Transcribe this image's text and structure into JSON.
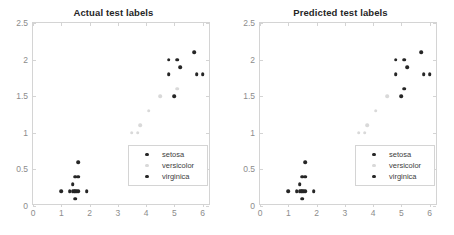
{
  "figure": {
    "background_color": "#ffffff",
    "axis_color": "#d4d4d4",
    "tick_label_color": "#8c8c8c",
    "title_color": "#262626"
  },
  "colors": {
    "setosa": "#262626",
    "versicolor": "#d9d9d9",
    "virginica": "#262626"
  },
  "legend": {
    "entries": [
      {
        "label": "setosa",
        "marker": "filled-circle-dark"
      },
      {
        "label": "versicolor",
        "marker": "filled-circle-light"
      },
      {
        "label": "virginica",
        "marker": "filled-circle-dark"
      }
    ]
  },
  "axis": {
    "xticks": [
      "0",
      "1",
      "2",
      "3",
      "4",
      "5",
      "6"
    ],
    "yticks": [
      "0",
      "0.5",
      "1",
      "1.5",
      "2",
      "2.5"
    ]
  },
  "chart_data": [
    {
      "type": "scatter",
      "title": "Actual test labels",
      "xlabel": "",
      "ylabel": "",
      "xlim": [
        0,
        6.3
      ],
      "ylim": [
        0,
        2.5
      ],
      "xticks": [
        0,
        1,
        2,
        3,
        4,
        5,
        6
      ],
      "yticks": [
        0,
        0.5,
        1,
        1.5,
        2,
        2.5
      ],
      "grid": false,
      "legend_position": "lower-right",
      "series": [
        {
          "name": "setosa",
          "color": "#262626",
          "points": [
            [
              1.0,
              0.2
            ],
            [
              1.3,
              0.2
            ],
            [
              1.4,
              0.2
            ],
            [
              1.45,
              0.2
            ],
            [
              1.5,
              0.2
            ],
            [
              1.55,
              0.2
            ],
            [
              1.6,
              0.2
            ],
            [
              1.9,
              0.2
            ],
            [
              1.4,
              0.3
            ],
            [
              1.5,
              0.4
            ],
            [
              1.6,
              0.4
            ],
            [
              1.6,
              0.6
            ],
            [
              1.5,
              0.1
            ]
          ]
        },
        {
          "name": "versicolor",
          "color": "#d9d9d9",
          "points": [
            [
              3.5,
              1.0
            ],
            [
              3.7,
              1.0
            ],
            [
              3.8,
              1.1
            ],
            [
              4.1,
              1.3
            ],
            [
              4.5,
              1.5
            ],
            [
              5.1,
              1.6
            ]
          ]
        },
        {
          "name": "virginica",
          "color": "#262626",
          "points": [
            [
              4.8,
              2.0
            ],
            [
              5.1,
              2.0
            ],
            [
              5.7,
              2.1
            ],
            [
              4.8,
              1.8
            ],
            [
              5.2,
              1.9
            ],
            [
              5.8,
              1.8
            ],
            [
              6.0,
              1.8
            ],
            [
              5.0,
              1.5
            ]
          ]
        }
      ]
    },
    {
      "type": "scatter",
      "title": "Predicted test labels",
      "xlabel": "",
      "ylabel": "",
      "xlim": [
        0,
        6.3
      ],
      "ylim": [
        0,
        2.5
      ],
      "xticks": [
        0,
        1,
        2,
        3,
        4,
        5,
        6
      ],
      "yticks": [
        0,
        0.5,
        1,
        1.5,
        2,
        2.5
      ],
      "grid": false,
      "legend_position": "lower-right",
      "series": [
        {
          "name": "setosa",
          "color": "#262626",
          "points": [
            [
              1.0,
              0.2
            ],
            [
              1.3,
              0.2
            ],
            [
              1.4,
              0.2
            ],
            [
              1.45,
              0.2
            ],
            [
              1.5,
              0.2
            ],
            [
              1.55,
              0.2
            ],
            [
              1.6,
              0.2
            ],
            [
              1.9,
              0.2
            ],
            [
              1.4,
              0.3
            ],
            [
              1.5,
              0.4
            ],
            [
              1.6,
              0.4
            ],
            [
              1.6,
              0.6
            ],
            [
              1.5,
              0.1
            ]
          ]
        },
        {
          "name": "versicolor",
          "color": "#d9d9d9",
          "points": [
            [
              3.5,
              1.0
            ],
            [
              3.7,
              1.0
            ],
            [
              3.8,
              1.1
            ],
            [
              4.1,
              1.3
            ],
            [
              4.5,
              1.5
            ]
          ]
        },
        {
          "name": "virginica",
          "color": "#262626",
          "points": [
            [
              4.8,
              2.0
            ],
            [
              5.1,
              2.0
            ],
            [
              5.7,
              2.1
            ],
            [
              4.8,
              1.8
            ],
            [
              5.2,
              1.9
            ],
            [
              5.8,
              1.8
            ],
            [
              6.0,
              1.8
            ],
            [
              5.0,
              1.5
            ],
            [
              5.1,
              1.6
            ]
          ]
        }
      ]
    }
  ]
}
